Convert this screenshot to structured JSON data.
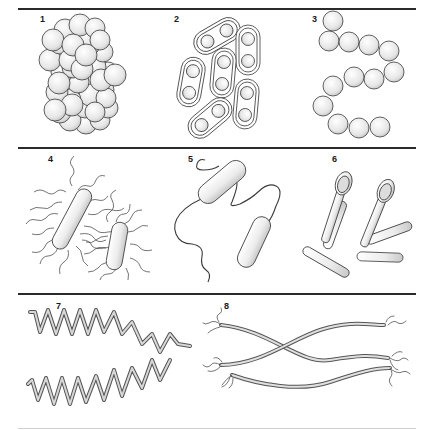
{
  "figure": {
    "panels": [
      {
        "number": "1",
        "label": "1",
        "form": "staphylococci (grape-like cluster of cocci)"
      },
      {
        "number": "2",
        "label": "2",
        "form": "diplococci (encapsulated pairs)"
      },
      {
        "number": "3",
        "label": "3",
        "form": "streptococci (chain of cocci)"
      },
      {
        "number": "4",
        "label": "4",
        "form": "peritrichous bacilli"
      },
      {
        "number": "5",
        "label": "5",
        "form": "bacilli with polar flagellum"
      },
      {
        "number": "6",
        "label": "6",
        "form": "spore-forming bacilli (clostridia)"
      },
      {
        "number": "7",
        "label": "7",
        "form": "spirilla / spirochetes (helical)"
      },
      {
        "number": "8",
        "label": "8",
        "form": "treponema-like filaments with terminal tufts"
      }
    ]
  },
  "colors": {
    "rule": "#2a2a2a",
    "outline": "#3a3a3a",
    "cell_fill_light": "#ffffff",
    "cell_fill_shade": "#cfcfcf",
    "spiral_fill": "#bdbdbd"
  }
}
